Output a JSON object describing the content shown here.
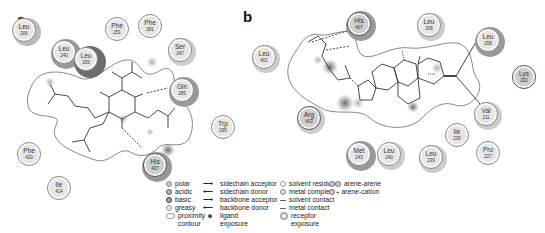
{
  "panels": [
    {
      "label": "a",
      "residues": [
        {
          "name": "Leu",
          "num": "206",
          "x": 12,
          "y": 18
        },
        {
          "name": "Leu",
          "num": "240",
          "x": 52,
          "y": 40
        },
        {
          "name": "Leu",
          "num": "209",
          "x": 74,
          "y": 47
        },
        {
          "name": "Phe",
          "num": "251",
          "x": 105,
          "y": 17
        },
        {
          "name": "Phe",
          "num": "281",
          "x": 138,
          "y": 14
        },
        {
          "name": "Ser",
          "num": "247",
          "x": 168,
          "y": 38
        },
        {
          "name": "Gln",
          "num": "285",
          "x": 170,
          "y": 78
        },
        {
          "name": "Trp",
          "num": "295",
          "x": 211,
          "y": 115
        },
        {
          "name": "His",
          "num": "407",
          "x": 143,
          "y": 153
        },
        {
          "name": "Phe",
          "num": "420",
          "x": 17,
          "y": 142
        },
        {
          "name": "Ile",
          "num": "414",
          "x": 47,
          "y": 176
        }
      ]
    },
    {
      "label": "b",
      "residues": [
        {
          "name": "His",
          "num": "407",
          "x": 347,
          "y": 12
        },
        {
          "name": "Leu",
          "num": "206",
          "x": 417,
          "y": 13
        },
        {
          "name": "Leu",
          "num": "208",
          "x": 476,
          "y": 28
        },
        {
          "name": "Leu",
          "num": "401",
          "x": 252,
          "y": 45
        },
        {
          "name": "Lys",
          "num": "202",
          "x": 512,
          "y": 65
        },
        {
          "name": "Val",
          "num": "211",
          "x": 474,
          "y": 102
        },
        {
          "name": "Arg",
          "num": "403",
          "x": 297,
          "y": 106
        },
        {
          "name": "Ile",
          "num": "236",
          "x": 445,
          "y": 123
        },
        {
          "name": "Met",
          "num": "243",
          "x": 347,
          "y": 142
        },
        {
          "name": "Leu",
          "num": "240",
          "x": 377,
          "y": 142
        },
        {
          "name": "Leu",
          "num": "239",
          "x": 419,
          "y": 145
        },
        {
          "name": "Pro",
          "num": "227",
          "x": 476,
          "y": 141
        }
      ]
    }
  ],
  "legend": {
    "residue_types": [
      {
        "label": "polar",
        "color": "#c8c8c8"
      },
      {
        "label": "acidic",
        "color": "#9a9a9a"
      },
      {
        "label": "basic",
        "color": "#7a7a7a"
      },
      {
        "label": "greasy",
        "color": "#e4e4e4"
      },
      {
        "label": "proximity",
        "color": "#ffffff"
      },
      {
        "label": "contour",
        "color": ""
      }
    ],
    "interactions": [
      {
        "symbol": "⟶",
        "label": "sidechain acceptor"
      },
      {
        "symbol": "⟵",
        "label": "sidechain donor"
      },
      {
        "symbol": "⟶",
        "label": "backbone acceptor"
      },
      {
        "symbol": "⟵",
        "label": "backbone donor"
      },
      {
        "symbol": "●",
        "label": "ligand"
      },
      {
        "symbol": "",
        "label": "exposure"
      }
    ],
    "solvent": [
      {
        "label": "solvent residue"
      },
      {
        "label": "metal complex"
      },
      {
        "label": "solvent contact"
      },
      {
        "label": "metal contact"
      },
      {
        "label": "receptor"
      },
      {
        "label": "exposure"
      }
    ],
    "pi": [
      {
        "label": "arene-arene"
      },
      {
        "label": "arene-cation"
      }
    ]
  }
}
